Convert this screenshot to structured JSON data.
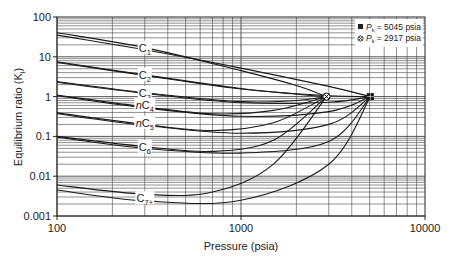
{
  "chart_data": {
    "type": "line",
    "title": "",
    "xlabel": "Pressure (psia)",
    "ylabel": "Equilibrium ratio (K",
    "ylabel_sub": "i",
    "ylabel_close": ")",
    "xscale": "log",
    "yscale": "log",
    "xlim": [
      100,
      10000
    ],
    "ylim": [
      0.001,
      100
    ],
    "x_ticks": [
      "100",
      "1000",
      "10000"
    ],
    "y_ticks": [
      "0.001",
      "0.01",
      "0.1",
      "1",
      "10",
      "100"
    ],
    "grid": true,
    "legend": {
      "position": "upper right",
      "entries": [
        {
          "marker": "square",
          "label_pre": "P",
          "label_sub": "k",
          "label_post": " = 5045 psia"
        },
        {
          "marker": "x-circle",
          "label_pre": "P",
          "label_sub": "k",
          "label_post": " = 2917 psia"
        }
      ]
    },
    "convergence_points": [
      {
        "name": "Pk = 2917 psia",
        "x": 2917,
        "y": 1,
        "marker": "x-circle"
      },
      {
        "name": "Pk = 5045 psia",
        "x": 5045,
        "y": 1,
        "marker": "square"
      }
    ],
    "series": [
      {
        "name": "C1 (Pk=2917)",
        "label": "C1",
        "x": [
          100,
          300,
          1000,
          2000,
          2917
        ],
        "y": [
          40,
          17,
          4.5,
          1.9,
          1
        ]
      },
      {
        "name": "C1 (Pk=5045)",
        "label": "C1",
        "x": [
          100,
          300,
          1000,
          3000,
          5045
        ],
        "y": [
          35,
          15,
          5.2,
          1.8,
          1
        ]
      },
      {
        "name": "C2 (Pk=2917)",
        "label": "C2",
        "x": [
          100,
          300,
          1000,
          2000,
          2917
        ],
        "y": [
          7.5,
          3.5,
          1.6,
          1.15,
          1
        ]
      },
      {
        "name": "C2 (Pk=5045)",
        "label": "C2",
        "x": [
          100,
          300,
          1000,
          3000,
          5045
        ],
        "y": [
          7.2,
          3.4,
          1.55,
          1.05,
          1
        ]
      },
      {
        "name": "C3 (Pk=2917)",
        "label": "C3",
        "x": [
          100,
          300,
          1000,
          2000,
          2917
        ],
        "y": [
          2.4,
          1.25,
          0.75,
          0.8,
          1
        ]
      },
      {
        "name": "C3 (Pk=5045)",
        "label": "C3",
        "x": [
          100,
          300,
          1000,
          3000,
          5045
        ],
        "y": [
          2.3,
          1.2,
          0.7,
          0.72,
          1
        ]
      },
      {
        "name": "nC4 (Pk=2917)",
        "label": "nC4",
        "x": [
          100,
          300,
          700,
          1500,
          2917
        ],
        "y": [
          1.1,
          0.55,
          0.37,
          0.45,
          1
        ]
      },
      {
        "name": "nC4 (Pk=5045)",
        "label": "nC4",
        "x": [
          100,
          300,
          1000,
          3000,
          5045
        ],
        "y": [
          1.05,
          0.52,
          0.32,
          0.42,
          1
        ]
      },
      {
        "name": "nC5 (Pk=2917)",
        "label": "nC5",
        "x": [
          100,
          300,
          700,
          1500,
          2917
        ],
        "y": [
          0.39,
          0.2,
          0.14,
          0.22,
          1
        ]
      },
      {
        "name": "nC5 (Pk=5045)",
        "label": "nC5",
        "x": [
          100,
          300,
          1000,
          3000,
          5045
        ],
        "y": [
          0.37,
          0.19,
          0.12,
          0.2,
          1
        ]
      },
      {
        "name": "C6 (Pk=2917)",
        "label": "C6",
        "x": [
          100,
          300,
          700,
          1500,
          2917
        ],
        "y": [
          0.1,
          0.055,
          0.042,
          0.08,
          1
        ]
      },
      {
        "name": "C6 (Pk=5045)",
        "label": "C6",
        "x": [
          100,
          300,
          1000,
          3000,
          5045
        ],
        "y": [
          0.095,
          0.05,
          0.038,
          0.075,
          1
        ]
      },
      {
        "name": "C7+ (Pk=2917)",
        "label": "C7+",
        "x": [
          100,
          300,
          700,
          1500,
          2917
        ],
        "y": [
          0.006,
          0.0035,
          0.004,
          0.02,
          1
        ]
      },
      {
        "name": "C7+ (Pk=5045)",
        "label": "C7+",
        "x": [
          100,
          300,
          1000,
          3000,
          5045
        ],
        "y": [
          0.0045,
          0.0024,
          0.0025,
          0.02,
          1
        ]
      }
    ],
    "curve_labels": [
      {
        "text": "C",
        "sub": "1",
        "x": 300,
        "y": 17
      },
      {
        "text": "C",
        "sub": "2",
        "x": 300,
        "y": 3.5
      },
      {
        "text": "C",
        "sub": "3",
        "x": 300,
        "y": 1.25
      },
      {
        "text": "nC",
        "sub": "4",
        "x": 300,
        "y": 0.62
      },
      {
        "text": "nC",
        "sub": "5",
        "x": 300,
        "y": 0.22
      },
      {
        "text": "C",
        "sub": "6",
        "x": 300,
        "y": 0.055
      },
      {
        "text": "C",
        "sub": "7+",
        "x": 300,
        "y": 0.0028
      }
    ]
  },
  "colors": {
    "line": "#1a1a1a",
    "grid": "#444444",
    "axis": "#222222"
  }
}
